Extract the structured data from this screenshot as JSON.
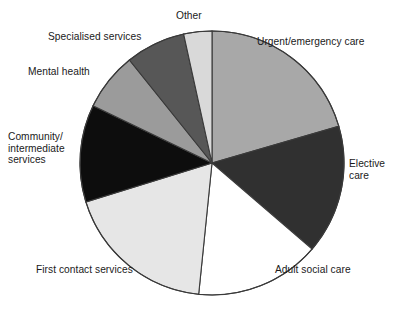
{
  "page": {
    "background_color": "#ffffff",
    "title_remnant": "cropped title line"
  },
  "chart_data": {
    "type": "pie",
    "title": "",
    "subtitle": "",
    "xlabel": "",
    "ylabel": "",
    "legend_position": "outside-labels",
    "grid": false,
    "start_angle_deg": 0,
    "direction": "clockwise",
    "center": {
      "x": 212,
      "y": 163
    },
    "radius": 132,
    "categories": [
      "Urgent/emergency care",
      "Elective care",
      "Adult social care",
      "First contact services",
      "Community/\nintermediate\nservices",
      "Mental health",
      "Specialised services",
      "Other"
    ],
    "values": [
      20.5,
      15.8,
      15.3,
      18.6,
      11.9,
      7.0,
      7.3,
      3.6
    ],
    "slices": [
      {
        "label": "Urgent/emergency care",
        "value": 20.5,
        "start_deg": 0,
        "end_deg": 73.8,
        "color": "#a8a8a8",
        "label_x": 257,
        "label_y": 36
      },
      {
        "label": "Elective care",
        "value": 15.8,
        "start_deg": 73.8,
        "end_deg": 130.7,
        "color": "#303030",
        "label_x": 349,
        "label_y": 158
      },
      {
        "label": "Adult social care",
        "value": 15.3,
        "start_deg": 130.7,
        "end_deg": 185.8,
        "color": "#ffffff",
        "label_x": 275,
        "label_y": 264
      },
      {
        "label": "First contact services",
        "value": 18.6,
        "start_deg": 185.8,
        "end_deg": 252.8,
        "color": "#e6e6e6",
        "label_x": 36,
        "label_y": 264
      },
      {
        "label": "Community/\nintermediate\nservices",
        "value": 11.9,
        "start_deg": 252.8,
        "end_deg": 295.7,
        "color": "#0d0d0d",
        "label_x": 8,
        "label_y": 131
      },
      {
        "label": "Mental health",
        "value": 7.0,
        "start_deg": 295.7,
        "end_deg": 321.3,
        "color": "#9b9b9b",
        "label_x": 28,
        "label_y": 66
      },
      {
        "label": "Specialised services",
        "value": 7.3,
        "start_deg": 321.3,
        "end_deg": 347.6,
        "color": "#575757",
        "label_x": 48,
        "label_y": 31
      },
      {
        "label": "Other",
        "value": 3.6,
        "start_deg": 347.6,
        "end_deg": 360,
        "color": "#d9d9d9",
        "label_x": 176,
        "label_y": 10
      }
    ],
    "colors": {
      "urgent_emergency_care": "#a8a8a8",
      "elective_care": "#303030",
      "adult_social_care": "#ffffff",
      "first_contact_services": "#e6e6e6",
      "community_intermediate_services": "#0d0d0d",
      "mental_health": "#9b9b9b",
      "specialised_services": "#575757",
      "other": "#d9d9d9",
      "outline": "#3a3a3a",
      "label_text": "#1a1a1a"
    }
  },
  "labels": {
    "other": "Other",
    "urgent": "Urgent/emergency care",
    "elective": "Elective\ncare",
    "adult": "Adult social care",
    "first_contact": "First contact services",
    "community": "Community/\nintermediate\nservices",
    "mental_health": "Mental health",
    "specialised": "Specialised services"
  }
}
